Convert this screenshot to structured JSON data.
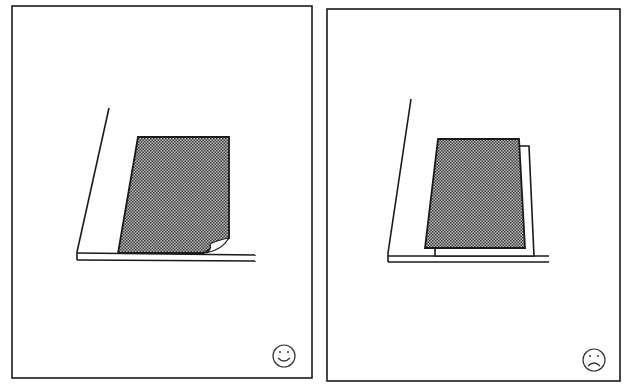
{
  "figure": {
    "type": "comparison-illustration",
    "background": "#ffffff",
    "line_color": "#1a1a1a",
    "shade_color": "#6e6e6e",
    "panels": [
      {
        "id": "left",
        "verdict": "correct",
        "indicator_icon": "smiley-face-icon",
        "description": "Document placed flush against the glass edge, lying flat with a small curled corner"
      },
      {
        "id": "right",
        "verdict": "incorrect",
        "indicator_icon": "frowning-face-icon",
        "description": "Document placed askew on top of another sheet, not aligned to the guide"
      }
    ]
  }
}
